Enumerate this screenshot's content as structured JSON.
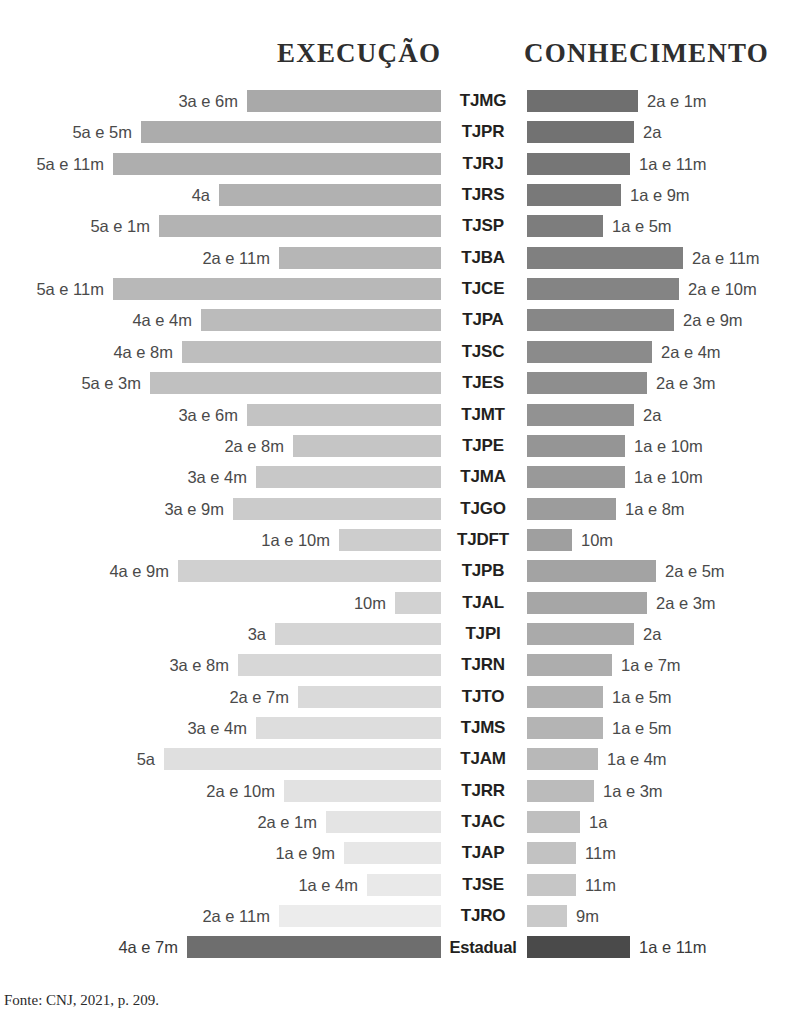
{
  "headers": {
    "left": "EXECUÇÃO",
    "right": "CONHECIMENTO"
  },
  "footer": "Fonte: CNJ, 2021, p. 209.",
  "colors": {
    "left_top": "#a9a9a9",
    "left_bottom": "#ececec",
    "right_top": "#6f6f6f",
    "right_bottom": "#c9c9c9",
    "total_left": "#6e6e6e",
    "total_right": "#4a4a4a",
    "label_text": "#4a4a4a",
    "category_text": "#231f20"
  },
  "chart_data": {
    "type": "bar",
    "title": "",
    "subtitle": "",
    "orientation": "horizontal-diverging",
    "xlabel": "",
    "ylabel": "",
    "grid": false,
    "legend_position": "top",
    "categories": [
      "TJMG",
      "TJPR",
      "TJRJ",
      "TJRS",
      "TJSP",
      "TJBA",
      "TJCE",
      "TJPA",
      "TJSC",
      "TJES",
      "TJMT",
      "TJPE",
      "TJMA",
      "TJGO",
      "TJDFT",
      "TJPB",
      "TJAL",
      "TJPI",
      "TJRN",
      "TJTO",
      "TJMS",
      "TJAM",
      "TJRR",
      "TJAC",
      "TJAP",
      "TJSE",
      "TJRO",
      "Estadual"
    ],
    "series": [
      {
        "name": "EXECUÇÃO",
        "side": "left",
        "unit": "anos e meses",
        "labels": [
          "3a e 6m",
          "5a e 5m",
          "5a e 11m",
          "4a",
          "5a e 1m",
          "2a e 11m",
          "5a e 11m",
          "4a e 4m",
          "4a e 8m",
          "5a e 3m",
          "3a e 6m",
          "2a e 8m",
          "3a e 4m",
          "3a e 9m",
          "1a e 10m",
          "4a e 9m",
          "10m",
          "3a",
          "3a e 8m",
          "2a e 7m",
          "3a e 4m",
          "5a",
          "2a e 10m",
          "2a e 1m",
          "1a e 9m",
          "1a e 4m",
          "2a e 11m",
          "4a e 7m"
        ],
        "values_months": [
          42,
          65,
          71,
          48,
          61,
          35,
          71,
          52,
          56,
          63,
          42,
          32,
          40,
          45,
          22,
          57,
          10,
          36,
          44,
          31,
          40,
          60,
          34,
          25,
          21,
          16,
          35,
          55
        ]
      },
      {
        "name": "CONHECIMENTO",
        "side": "right",
        "unit": "anos e meses",
        "labels": [
          "2a e 1m",
          "2a",
          "1a e 11m",
          "1a e 9m",
          "1a e 5m",
          "2a e 11m",
          "2a e 10m",
          "2a e 9m",
          "2a e 4m",
          "2a e 3m",
          "2a",
          "1a e 10m",
          "1a e 10m",
          "1a e 8m",
          "10m",
          "2a e 5m",
          "2a e 3m",
          "2a",
          "1a e 7m",
          "1a e 5m",
          "1a e 5m",
          "1a e 4m",
          "1a e 3m",
          "1a",
          "11m",
          "11m",
          "9m",
          "1a e 11m"
        ],
        "values_months": [
          25,
          24,
          23,
          21,
          17,
          35,
          34,
          33,
          28,
          27,
          24,
          22,
          22,
          20,
          10,
          29,
          27,
          24,
          19,
          17,
          17,
          16,
          15,
          12,
          11,
          11,
          9,
          23
        ]
      }
    ]
  }
}
